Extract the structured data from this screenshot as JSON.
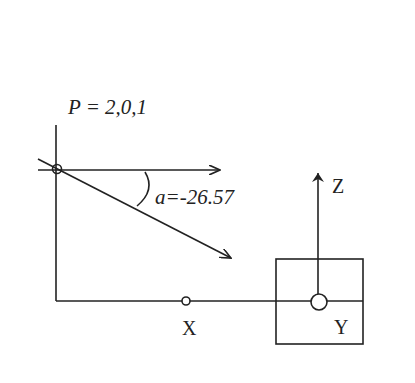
{
  "diagram": {
    "point_label": "P = 2,0,1",
    "angle_label": "a=-26.57",
    "axis_x_label": "X",
    "axis_y_label": "Y",
    "axis_z_label": "Z",
    "stroke_color": "#222222",
    "background": "#ffffff"
  }
}
